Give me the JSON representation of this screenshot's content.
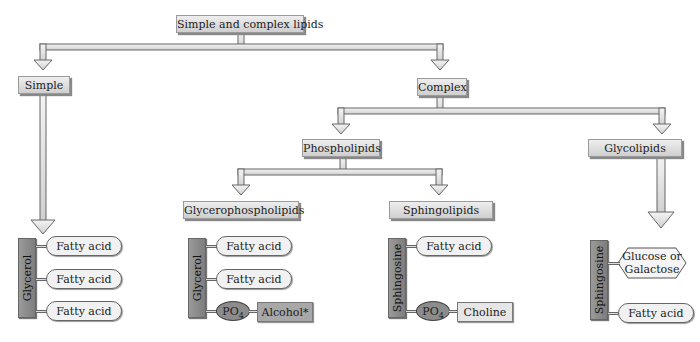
{
  "diagram": {
    "title": "Simple and complex lipids",
    "nodes": {
      "root": "Simple and complex lipids",
      "simple": "Simple",
      "complex": "Complex",
      "phospholipids": "Phospholipids",
      "glycolipids": "Glycolipids",
      "glycerophospholipids": "Glycerophospholipids",
      "sphingolipids": "Sphingolipids"
    },
    "structures": {
      "triglyceride": {
        "backbone": "Glycerol",
        "chains": [
          "Fatty acid",
          "Fatty acid",
          "Fatty acid"
        ]
      },
      "glycerophospholipid": {
        "backbone": "Glycerol",
        "chains": [
          "Fatty acid",
          "Fatty acid"
        ],
        "phosphate": "PO",
        "phosphate_sub": "4",
        "headgroup": "Alcohol*"
      },
      "sphingophospholipid": {
        "backbone": "Sphingosine",
        "chains": [
          "Fatty acid"
        ],
        "phosphate": "PO",
        "phosphate_sub": "4",
        "headgroup": "Choline"
      },
      "glycolipid": {
        "backbone": "Sphingosine",
        "sugar_line1": "Glucose or",
        "sugar_line2": "Galactose",
        "chains": [
          "Fatty acid"
        ]
      }
    },
    "edges": [
      [
        "Simple and complex lipids",
        "Simple"
      ],
      [
        "Simple and complex lipids",
        "Complex"
      ],
      [
        "Complex",
        "Phospholipids"
      ],
      [
        "Complex",
        "Glycolipids"
      ],
      [
        "Phospholipids",
        "Glycerophospholipids"
      ],
      [
        "Phospholipids",
        "Sphingolipids"
      ],
      [
        "Simple",
        "Glycerol triester"
      ],
      [
        "Glycolipids",
        "Sphingosine glycolipid"
      ]
    ]
  }
}
